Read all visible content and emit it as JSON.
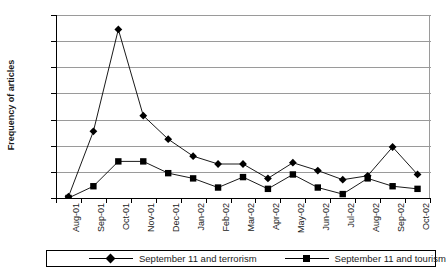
{
  "chart_data": {
    "type": "line",
    "title": "",
    "xlabel": "",
    "ylabel": "Frequency of articles",
    "ylim": [
      0,
      140
    ],
    "ytick_step": 20,
    "yticks": [
      0,
      20,
      40,
      60,
      80,
      100,
      120,
      140
    ],
    "grid": true,
    "legend_position": "bottom",
    "categories": [
      "Aug-01",
      "Sep-01",
      "Oct-01",
      "Nov-01",
      "Dec-01",
      "Jan-02",
      "Feb-02",
      "Mar-02",
      "Apr-02",
      "May-02",
      "Jun-02",
      "Jul-02",
      "Aug-02",
      "Sep-02",
      "Oct-02"
    ],
    "series": [
      {
        "name": "September 11 and terrorism",
        "marker": "diamond",
        "values": [
          1,
          51,
          129,
          63,
          45,
          32,
          26,
          26,
          15,
          27,
          21,
          14,
          17,
          39,
          18
        ]
      },
      {
        "name": "September 11 and tourism",
        "marker": "square",
        "values": [
          0,
          9,
          28,
          28,
          19,
          15,
          8,
          16,
          7,
          18,
          8,
          3,
          15,
          9,
          7
        ]
      }
    ]
  },
  "axes": {
    "y_title": "Frequency of articles",
    "ytick_labels": [
      "140",
      "120",
      "100",
      "80",
      "60",
      "40",
      "20",
      "0"
    ],
    "xtick_labels": [
      "Aug-01",
      "Sep-01",
      "Oct-01",
      "Nov-01",
      "Dec-01",
      "Jan-02",
      "Feb-02",
      "Mar-02",
      "Apr-02",
      "May-02",
      "Jun-02",
      "Jul-02",
      "Aug-02",
      "Sep-02",
      "Oct-02"
    ]
  },
  "legend": {
    "entries": [
      {
        "label": "September 11 and terrorism",
        "marker": "diamond-marker-icon"
      },
      {
        "label": "September 11 and tourism",
        "marker": "square-marker-icon"
      }
    ]
  },
  "colors": {
    "series_line": "#000000",
    "grid": "#9a9a9a",
    "axis": "#000000",
    "background": "#ffffff"
  }
}
